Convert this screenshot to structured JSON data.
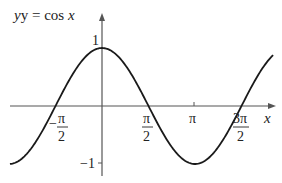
{
  "chart_data": {
    "type": "line",
    "title": "y = cos x",
    "function": "cos",
    "xlabel": "x",
    "ylabel": "y = cos x",
    "x_range_rad": [
      -3.11,
      5.78
    ],
    "y_range": [
      -1,
      1
    ],
    "x_ticks": [
      "-π/2",
      "π/2",
      "π",
      "3π/2"
    ],
    "x_tick_values": [
      -1.5708,
      1.5708,
      3.1416,
      4.7124
    ],
    "y_ticks": [
      "1",
      "-1"
    ],
    "y_tick_values": [
      1,
      -1
    ],
    "grid": false,
    "colors": {
      "curve": "#1a1a1a",
      "axes": "#555555"
    }
  },
  "labels": {
    "title_y": "y = cos ",
    "title_x": "x",
    "axis_x": "x",
    "tick_1": "1",
    "tick_neg1": "−1",
    "neg_pi_half_num": "π",
    "neg_pi_half_den": "2",
    "neg_sign": "−",
    "pi_half_num": "π",
    "pi_half_den": "2",
    "pi": "π",
    "three_pi_half_num": "3π",
    "three_pi_half_den": "2"
  }
}
